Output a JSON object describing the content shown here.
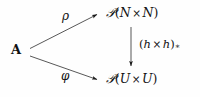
{
  "diagram": {
    "kind": "commutative-diagram",
    "background_color": "#fefefe",
    "ink_color": "#111111",
    "nodes": [
      {
        "id": "source",
        "name": "node-A",
        "label": "A",
        "style": "bold-upright",
        "x": 11,
        "y": 43
      },
      {
        "id": "top-right",
        "name": "node-P-N-times-N",
        "label": "𝒫(N × N)",
        "powerset_symbol": "𝒫",
        "open_paren": "(",
        "left_set": "N",
        "times": "×",
        "right_set": "N",
        "close_paren": ")",
        "x": 106,
        "y": 6
      },
      {
        "id": "bottom-right",
        "name": "node-P-U-times-U",
        "label": "𝒫(U × U)",
        "powerset_symbol": "𝒫",
        "open_paren": "(",
        "left_set": "U",
        "times": "×",
        "right_set": "U",
        "close_paren": ")",
        "x": 106,
        "y": 72
      }
    ],
    "arrows": [
      {
        "id": "rho",
        "name": "arrow-rho",
        "from": "source",
        "to": "top-right",
        "label": "ρ",
        "label_x": 62,
        "label_y": 10,
        "x1": 30,
        "y1": 48,
        "x2": 99,
        "y2": 15
      },
      {
        "id": "phi",
        "name": "arrow-phi",
        "from": "source",
        "to": "bottom-right",
        "label": "φ",
        "label_x": 61,
        "label_y": 70,
        "x1": 30,
        "y1": 56,
        "x2": 99,
        "y2": 80
      },
      {
        "id": "hh-star",
        "name": "arrow-h-times-h-pushforward",
        "from": "top-right",
        "to": "bottom-right",
        "label": "(h × h)∗",
        "open_paren": "(",
        "left_map": "h",
        "times": "×",
        "right_map": "h",
        "close_paren": ")",
        "subscript": "∗",
        "label_x": 139,
        "label_y": 39,
        "x1": 131,
        "y1": 27,
        "x2": 131,
        "y2": 68
      }
    ]
  }
}
